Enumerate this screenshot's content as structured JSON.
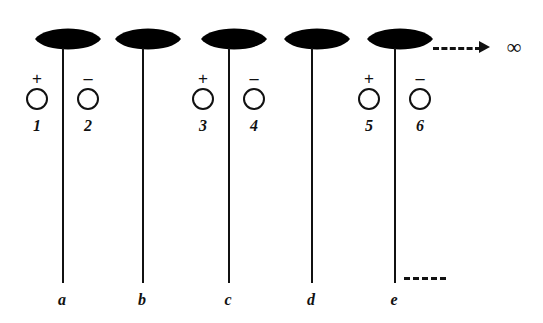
{
  "figure": {
    "title": "",
    "background_color": "#ffffff",
    "ink_color": "#111111",
    "width": 543,
    "height": 323,
    "type": "botanical-schematic-diagram"
  },
  "columns": [
    {
      "letter": "a",
      "stem_x": 62,
      "bud": {
        "cx": 68,
        "cy": 39,
        "rx": 33,
        "ry": 14
      },
      "has_markers": true,
      "markers": [
        {
          "sign": "+",
          "number": "1",
          "cx": 37
        },
        {
          "sign": "−",
          "number": "2",
          "cx": 88
        }
      ]
    },
    {
      "letter": "b",
      "stem_x": 142,
      "bud": {
        "cx": 148,
        "cy": 39,
        "rx": 33,
        "ry": 14
      },
      "has_markers": false,
      "markers": []
    },
    {
      "letter": "c",
      "stem_x": 228,
      "bud": {
        "cx": 234,
        "cy": 39,
        "rx": 33,
        "ry": 14
      },
      "has_markers": true,
      "markers": [
        {
          "sign": "+",
          "number": "3",
          "cx": 203
        },
        {
          "sign": "−",
          "number": "4",
          "cx": 254
        }
      ]
    },
    {
      "letter": "d",
      "stem_x": 311,
      "bud": {
        "cx": 317,
        "cy": 39,
        "rx": 33,
        "ry": 14
      },
      "has_markers": false,
      "markers": []
    },
    {
      "letter": "e",
      "stem_x": 394,
      "bud": {
        "cx": 400,
        "cy": 39,
        "rx": 33,
        "ry": 14
      },
      "has_markers": true,
      "markers": [
        {
          "sign": "+",
          "number": "5",
          "cx": 369
        },
        {
          "sign": "−",
          "number": "6",
          "cx": 420
        }
      ]
    }
  ],
  "geometry": {
    "stem_top_y": 48,
    "stem_bottom_y": 283,
    "sign_y": 70,
    "circle_y": 88,
    "number_y": 118,
    "letter_y": 292
  },
  "annotations": {
    "arrow": {
      "label": "dashed-arrow-to-infinity",
      "line_x": 433,
      "line_y": 47,
      "line_width": 48,
      "head_x": 481,
      "head_y": 41
    },
    "infinity_symbol": {
      "glyph": "∞",
      "x": 514,
      "y": 47
    },
    "basal_dash": {
      "label": "short-dashed-segment",
      "x": 404,
      "y": 277,
      "width": 42
    }
  }
}
